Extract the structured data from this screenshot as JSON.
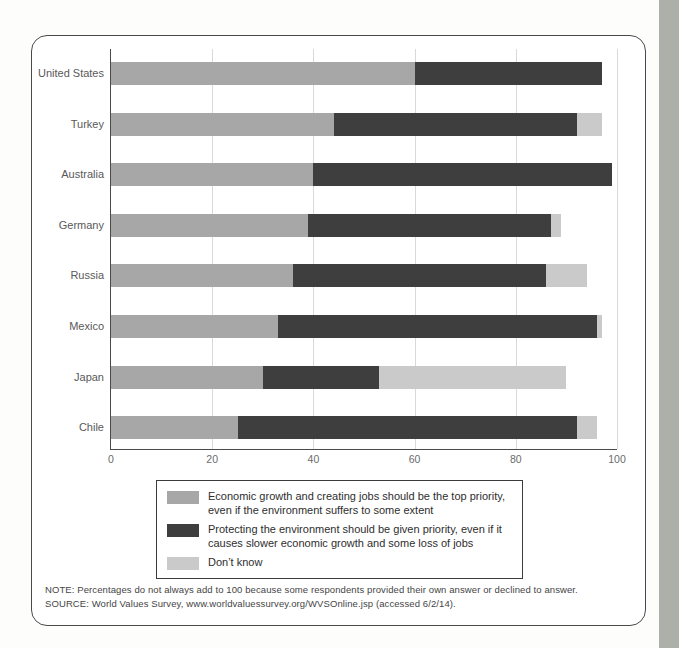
{
  "page": {
    "background_color": "#ffffff",
    "edge_strip_color": "#acb0a8"
  },
  "chart_data": {
    "type": "bar",
    "orientation": "horizontal",
    "stacked": true,
    "categories": [
      "United States",
      "Turkey",
      "Australia",
      "Germany",
      "Russia",
      "Mexico",
      "Japan",
      "Chile"
    ],
    "series": [
      {
        "name": "Economic growth and creating jobs should be the top priority, even if the environment suffers to some extent",
        "color": "#a7a7a7",
        "values": [
          60,
          44,
          40,
          39,
          36,
          33,
          30,
          25
        ]
      },
      {
        "name": "Protecting the environment should be given priority, even if it causes slower economic growth and some loss of jobs",
        "color": "#3e3e3e",
        "values": [
          37,
          48,
          59,
          48,
          50,
          63,
          23,
          67
        ]
      },
      {
        "name": "Don’t know",
        "color": "#cacaca",
        "values": [
          0,
          5,
          0,
          2,
          8,
          1,
          37,
          4
        ]
      }
    ],
    "x_ticks": [
      0,
      20,
      40,
      60,
      80,
      100
    ],
    "xlim": [
      0,
      100
    ],
    "grid": "vertical-only",
    "gridline_color": "#d9d9d9",
    "axis_color": "#4a4a4a",
    "legend_position": "bottom-boxed"
  },
  "legend": {
    "items": [
      {
        "color": "#a7a7a7",
        "label": "Economic growth and creating jobs should be the top priority, even if the environment suffers to some extent"
      },
      {
        "color": "#3e3e3e",
        "label": "Protecting the environment should be given priority, even if it causes slower economic growth and some loss of jobs"
      },
      {
        "color": "#cacaca",
        "label": "Don’t know"
      }
    ]
  },
  "notes": {
    "note": "NOTE: Percentages do not always add to 100 because some respondents provided their own answer or declined to answer.",
    "source": "SOURCE: World Values Survey, www.worldvaluessurvey.org/WVSOnline.jsp (accessed 6/2/14)."
  }
}
